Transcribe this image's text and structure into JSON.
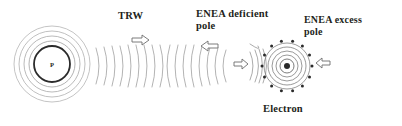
{
  "figure": {
    "background_color": "#ffffff",
    "ink_color": "#231f20",
    "faint_ink_color": "#b0b0b0",
    "width": 402,
    "height": 126
  },
  "labels": {
    "trw": "TRW",
    "enea_deficient_pole": "ENEA deficient\npole",
    "enea_excess_pole": "ENEA excess\npole",
    "electron": "Electron",
    "proton_symbol": "P"
  },
  "particles": {
    "proton": {
      "name": "Proton",
      "center_x": 52,
      "center_y": 64,
      "core_radius": 18,
      "symbol": "P",
      "halo_radii": [
        23,
        28,
        33,
        38
      ]
    },
    "electron": {
      "name": "Electron",
      "center_x": 287,
      "center_y": 66,
      "nucleus_radius": 3,
      "shell_radii": [
        7,
        11,
        15,
        19,
        23
      ],
      "dot_ring_radius": 25,
      "dot_count": 14
    }
  },
  "waves": {
    "name": "Transverse radiation wave field",
    "outgoing_arc_count": 15,
    "incoming_arc_count": 9,
    "electron_arc_count": 5
  },
  "arrows": [
    {
      "name": "trw-direction-arrow",
      "direction": "right",
      "x": 132,
      "y": 36,
      "label_ref": "trw"
    },
    {
      "name": "deficient-pole-arrow",
      "direction": "left",
      "x": 200,
      "y": 42,
      "label_ref": "enea_deficient_pole"
    },
    {
      "name": "wave-into-electron-arrow",
      "direction": "right",
      "x": 237,
      "y": 60,
      "label_ref": ""
    },
    {
      "name": "excess-pole-arrow",
      "direction": "left",
      "x": 316,
      "y": 59,
      "label_ref": "enea_excess_pole"
    }
  ],
  "colors": {
    "ink": "#231f20",
    "faint": "#a8a8a8",
    "mid": "#8c8c8c",
    "arrow_stroke": "#6e6e6e"
  }
}
